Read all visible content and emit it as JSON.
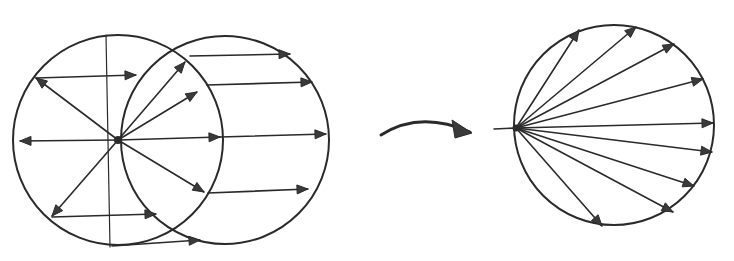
{
  "figure": {
    "description": "Hand-drawn sketch: wavefront of a point source moving with a circle (left, two overlapping circles with radiating and parallel arrows) transforms (curved arrow) into a fan of rays emanating from a point on a circle's rim (right).",
    "ink_color": "#2a2a2a",
    "background": "#ffffff",
    "panels": [
      {
        "id": "left",
        "label": "source-and-translated-circle",
        "circles": [
          {
            "cx": 118,
            "cy": 140,
            "r": 105
          },
          {
            "cx": 225,
            "cy": 140,
            "r": 104
          }
        ],
        "center_point": {
          "x": 118,
          "y": 140
        },
        "vertical_line": {
          "x1": 106,
          "y1": 35,
          "x2": 110,
          "y2": 247
        },
        "radial_arrows": [
          {
            "to": [
              36,
              78
            ]
          },
          {
            "to": [
              20,
              141
            ]
          },
          {
            "to": [
              52,
              216
            ]
          },
          {
            "to": [
              185,
              62
            ]
          },
          {
            "to": [
              197,
              92
            ]
          },
          {
            "to": [
              220,
              137
            ]
          },
          {
            "to": [
              204,
              192
            ]
          }
        ],
        "parallel_arrows": [
          {
            "from": [
              36,
              78
            ],
            "to": [
              136,
              75
            ]
          },
          {
            "from": [
              52,
              217
            ],
            "to": [
              156,
              214
            ]
          },
          {
            "from": [
              190,
              56
            ],
            "to": [
              290,
              54
            ]
          },
          {
            "from": [
              207,
              85
            ],
            "to": [
              312,
              82
            ]
          },
          {
            "from": [
              220,
              137
            ],
            "to": [
              326,
              134
            ]
          },
          {
            "from": [
              208,
              193
            ],
            "to": [
              308,
              189
            ]
          },
          {
            "from": [
              112,
              246
            ],
            "to": [
              200,
              240
            ]
          }
        ]
      },
      {
        "id": "transition",
        "label": "curved-transform-arrow",
        "path": "M 381 135 Q 420 110 470 132"
      },
      {
        "id": "right",
        "label": "ray-fan-circle",
        "circle": {
          "cx": 614,
          "cy": 125,
          "r": 100
        },
        "origin": {
          "x": 516,
          "y": 128
        },
        "stub": {
          "x1": 494,
          "y1": 129,
          "x2": 516,
          "y2": 128
        },
        "rays": [
          {
            "to": [
              579,
              30
            ]
          },
          {
            "to": [
              636,
              27
            ]
          },
          {
            "to": [
              674,
              44
            ]
          },
          {
            "to": [
              703,
              79
            ]
          },
          {
            "to": [
              713,
              123
            ]
          },
          {
            "to": [
              712,
              152
            ]
          },
          {
            "to": [
              694,
              186
            ]
          },
          {
            "to": [
              673,
              212
            ]
          },
          {
            "to": [
              602,
              226
            ]
          }
        ]
      }
    ]
  }
}
